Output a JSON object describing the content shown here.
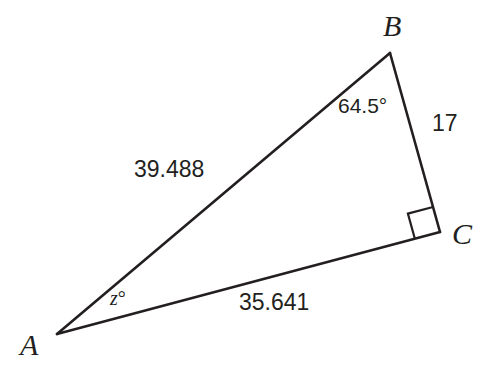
{
  "figure": {
    "type": "right-triangle",
    "background_color": "#ffffff",
    "stroke_color": "#231f20",
    "vertices": [
      {
        "name": "A",
        "label": "A",
        "x": 57,
        "y": 334
      },
      {
        "name": "B",
        "label": "B",
        "x": 390,
        "y": 53
      },
      {
        "name": "C",
        "label": "C",
        "x": 440,
        "y": 232
      }
    ],
    "sides": [
      {
        "name": "AB",
        "label": "39.488",
        "from": "A",
        "to": "B"
      },
      {
        "name": "AC",
        "label": "35.641",
        "from": "A",
        "to": "C"
      },
      {
        "name": "BC",
        "label": "17",
        "from": "B",
        "to": "C"
      }
    ],
    "angles": [
      {
        "at": "A",
        "label": "z°",
        "variable": "z",
        "degree_symbol": "°",
        "known": false
      },
      {
        "at": "B",
        "label": "64.5°",
        "value": 64.5,
        "known": true
      },
      {
        "at": "C",
        "label": "right angle",
        "value": 90,
        "marker": "square",
        "known": true
      }
    ]
  }
}
